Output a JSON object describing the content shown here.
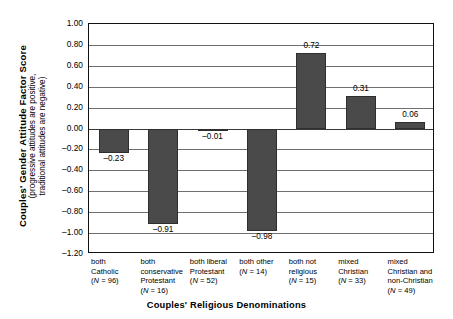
{
  "chart_data": {
    "type": "bar",
    "title": "",
    "xlabel": "Couples' Religious Denominations",
    "ylabel_main": "Couples' Gender  Attitude Factor Score",
    "ylabel_sub_line1": "(progressive attitudes are positive,",
    "ylabel_sub_line2": "traditional attitudes are negative)",
    "ylim": [
      -1.2,
      1.0
    ],
    "ytick_labels": [
      "1.00",
      "0.80",
      "0.60",
      "0.40",
      "0.20",
      "0.00",
      "–0.20",
      "–0.40",
      "–0.60",
      "–0.80",
      "–1.00",
      "–1.20"
    ],
    "ytick_values": [
      1.0,
      0.8,
      0.6,
      0.4,
      0.2,
      0.0,
      -0.2,
      -0.4,
      -0.6,
      -0.8,
      -1.0,
      -1.2
    ],
    "grid": true,
    "legend": "none",
    "bar_color": "#4a4a4a",
    "categories": [
      "both Catholic",
      "both conservative Protestant",
      "both liberal Protestant",
      "both other",
      "both not religious",
      "mixed Christian",
      "mixed Christian and non-Christian"
    ],
    "category_lines": [
      [
        "both",
        "Catholic"
      ],
      [
        "both",
        "conservative",
        "Protestant"
      ],
      [
        "both liberal",
        "Protestant"
      ],
      [
        "both other"
      ],
      [
        "both not",
        "religious"
      ],
      [
        "mixed",
        "Christian"
      ],
      [
        "mixed",
        "Christian and",
        "non-Christian"
      ]
    ],
    "n_labels": [
      "(N = 96)",
      "(N = 16)",
      "(N = 52)",
      "(N = 14)",
      "(N = 15)",
      "(N = 33)",
      "(N = 49)"
    ],
    "sample_sizes": [
      96,
      16,
      52,
      14,
      15,
      33,
      49
    ],
    "values": [
      -0.23,
      -0.91,
      -0.01,
      -0.98,
      0.72,
      0.31,
      0.06
    ],
    "value_labels": [
      "–0.23",
      "–0.91",
      "–0.01",
      "–0.98",
      "0.72",
      "0.31",
      "0.06"
    ]
  }
}
